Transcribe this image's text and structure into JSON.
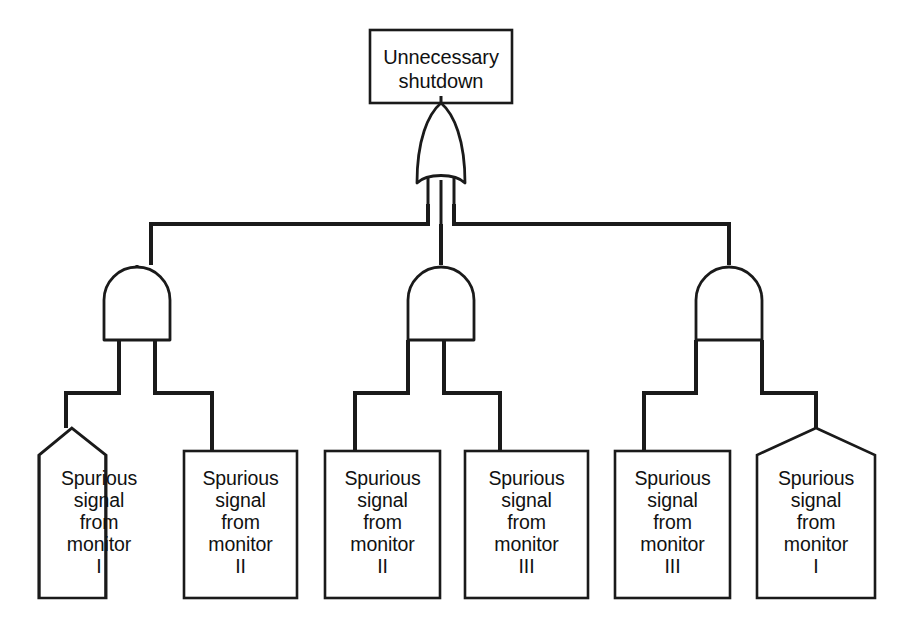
{
  "diagram": {
    "title_text": "Unnecessary\nshutdown",
    "top_event": {
      "label": "Unnecessary shutdown",
      "text": "Unnecessary\nshutdown",
      "shape": "rectangle"
    },
    "gates": [
      {
        "name": "or-gate-top",
        "type": "OR",
        "symbol": "or-gate-icon"
      },
      {
        "name": "and-gate-left",
        "type": "AND",
        "symbol": "and-gate-icon"
      },
      {
        "name": "and-gate-center",
        "type": "AND",
        "symbol": "and-gate-icon"
      },
      {
        "name": "and-gate-right",
        "type": "AND",
        "symbol": "and-gate-icon"
      }
    ],
    "basic_events": [
      {
        "id": "event-1",
        "shape": "house",
        "text": "Spurious\nsignal\nfrom\nmonitor\nI",
        "monitor": "I"
      },
      {
        "id": "event-2",
        "shape": "rectangle",
        "text": "Spurious\nsignal\nfrom\nmonitor\nII",
        "monitor": "II"
      },
      {
        "id": "event-3",
        "shape": "rectangle",
        "text": "Spurious\nsignal\nfrom\nmonitor\nII",
        "monitor": "II"
      },
      {
        "id": "event-4",
        "shape": "rectangle",
        "text": "Spurious\nsignal\nfrom\nmonitor\nIII",
        "monitor": "III"
      },
      {
        "id": "event-5",
        "shape": "rectangle",
        "text": "Spurious\nsignal\nfrom\nmonitor\nIII",
        "monitor": "III"
      },
      {
        "id": "event-6",
        "shape": "house",
        "text": "Spurious\nsignal\nfrom\nmonitor\nI",
        "monitor": "I"
      }
    ],
    "colors": {
      "line": "#1a1a1a",
      "background": "#ffffff",
      "text": "#111111"
    }
  }
}
